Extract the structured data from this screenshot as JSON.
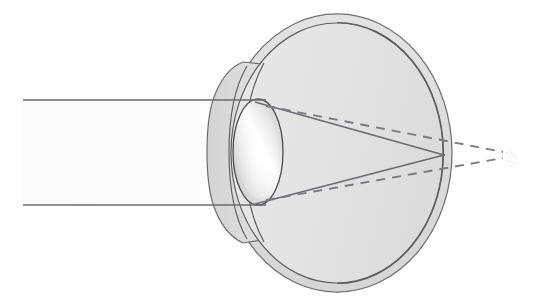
{
  "figure": {
    "background_color": "#ffffff",
    "width": 560,
    "height": 305
  },
  "palette": {
    "background": "#ffffff",
    "sclera_fill": "#dedede",
    "sclera_stroke": "#6e6e6e",
    "vitreous_fill": "#e4e4e4",
    "vitreous_stroke": "#5f5f5f",
    "cornea_fill": "#d8d8d8",
    "cornea_stroke": "#6a6a6a",
    "anterior_chamber_fill": "#dcdcdc",
    "lens_stroke": "#4f4f4f",
    "lens_highlight": "#fbfbfb",
    "lens_shadow": "#c6c6c6",
    "ray_solid": "#6b6b70",
    "ray_dashed": "#7a7a80",
    "beam_fill": "#fcfcfd"
  },
  "anatomy": {
    "parts": [
      {
        "id": "sclera",
        "label": "Sclera",
        "shape": "outer-ring-ellipse"
      },
      {
        "id": "retina",
        "label": "Retina",
        "shape": "inner-ellipse-boundary"
      },
      {
        "id": "vitreous-body",
        "label": "Vitreous body",
        "shape": "inner-ellipse-fill"
      },
      {
        "id": "cornea",
        "label": "Cornea",
        "shape": "anterior-bulge"
      },
      {
        "id": "anterior-chamber",
        "label": "Anterior chamber",
        "shape": "arc-band"
      },
      {
        "id": "iris",
        "label": "Iris",
        "shape": "arc-band"
      },
      {
        "id": "lens",
        "label": "Lens",
        "shape": "biconvex-ellipse"
      }
    ],
    "eyeball": {
      "center_x": 337,
      "center_y": 153,
      "outer_rx": 115,
      "outer_ry": 139,
      "inner_rx": 106,
      "inner_ry": 130
    },
    "lens_geometry": {
      "center_x": 258,
      "center_y": 152,
      "rx": 25,
      "ry": 53
    }
  },
  "optics": {
    "beam": {
      "label": "Incoming parallel light beam",
      "start_x": 23,
      "top_ray_y": 100,
      "bottom_ray_y": 205,
      "direction": "left-to-right"
    },
    "solid_rays": {
      "label": "Refracted rays (actual path)",
      "style": "solid",
      "converge_x": 444,
      "converge_y": 155,
      "focus_location": "on the retina"
    },
    "dashed_rays": {
      "label": "Projected rays (virtual focus behind the eye)",
      "style": "dashed",
      "dash_pattern": "9 7",
      "converge_x": 492,
      "converge_y": 155,
      "focus_location": "behind the retina"
    },
    "focal_point": {
      "label": "Focal point",
      "x": 444,
      "y": 155
    }
  }
}
